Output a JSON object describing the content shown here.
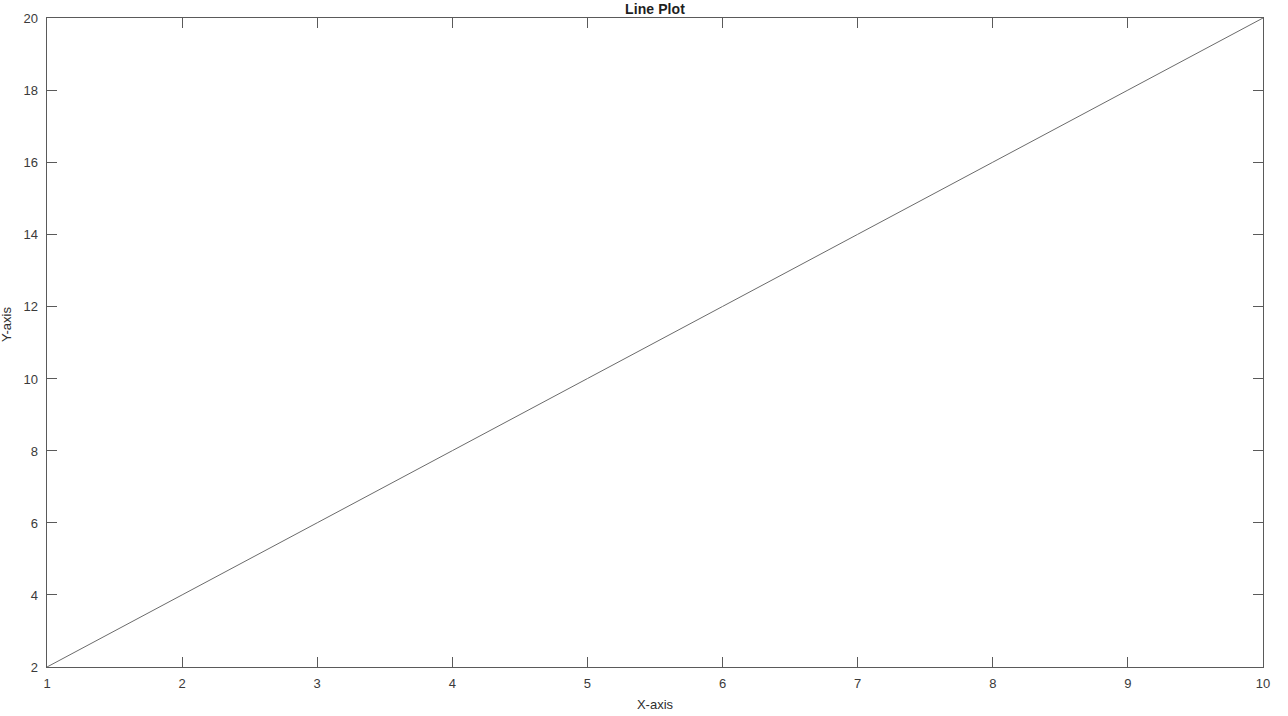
{
  "chart_data": {
    "type": "line",
    "title": "Line Plot",
    "xlabel": "X-axis",
    "ylabel": "Y-axis",
    "xlim": [
      1,
      10
    ],
    "ylim": [
      2,
      20
    ],
    "xticks": [
      1,
      2,
      3,
      4,
      5,
      6,
      7,
      8,
      9,
      10
    ],
    "yticks": [
      2,
      4,
      6,
      8,
      10,
      12,
      14,
      16,
      18,
      20
    ],
    "xtick_labels": [
      "1",
      "2",
      "3",
      "4",
      "5",
      "6",
      "7",
      "8",
      "9",
      "10"
    ],
    "ytick_labels": [
      "2",
      "4",
      "6",
      "8",
      "10",
      "12",
      "14",
      "16",
      "18",
      "20"
    ],
    "grid": false,
    "legend": null,
    "series": [
      {
        "name": "y = 2x",
        "color": "#6b6b6b",
        "linewidth": 1,
        "x": [
          1,
          2,
          3,
          4,
          5,
          6,
          7,
          8,
          9,
          10
        ],
        "values": [
          2,
          4,
          6,
          8,
          10,
          12,
          14,
          16,
          18,
          20
        ]
      }
    ],
    "axes_style": {
      "box": true,
      "tick_direction": "in",
      "axis_color": "#5a5a5a",
      "background": "#ffffff"
    }
  }
}
